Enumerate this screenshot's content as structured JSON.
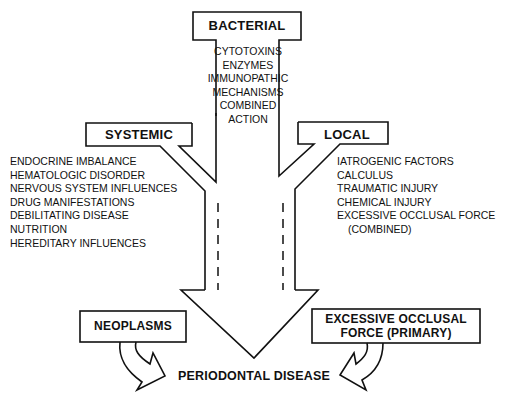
{
  "diagram": {
    "bacterial": {
      "label": "BACTERIAL",
      "items": [
        "CYTOTOXINS",
        "ENZYMES",
        "IMMUNOPATHIC",
        "MECHANISMS",
        "COMBINED",
        "ACTION"
      ]
    },
    "systemic": {
      "label": "SYSTEMIC",
      "items": [
        "ENDOCRINE IMBALANCE",
        "HEMATOLOGIC DISORDER",
        "NERVOUS SYSTEM INFLUENCES",
        "DRUG MANIFESTATIONS",
        "DEBILITATING DISEASE",
        "NUTRITION",
        "HEREDITARY INFLUENCES"
      ]
    },
    "local": {
      "label": "LOCAL",
      "items": [
        "IATROGENIC FACTORS",
        "CALCULUS",
        "TRAUMATIC INJURY",
        "CHEMICAL INJURY",
        "EXCESSIVE OCCLUSAL FORCE",
        "(COMBINED)"
      ]
    },
    "neoplasms": {
      "label": "NEOPLASMS"
    },
    "excessive_primary": {
      "line1": "EXCESSIVE OCCLUSAL",
      "line2": "FORCE (PRIMARY)"
    },
    "outcome": {
      "label": "PERIODONTAL DISEASE"
    },
    "colors": {
      "stroke": "#111111",
      "background": "#ffffff"
    }
  }
}
